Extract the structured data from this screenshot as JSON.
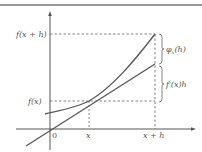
{
  "diagram": {
    "colors": {
      "axis": "#555555",
      "curve": "#5a5a5a",
      "tangent": "#5a5a5a",
      "dashed": "#666666",
      "border": "#777777",
      "text": "#555555"
    },
    "labels": {
      "fxh": "f(x + h)",
      "fx": "f(x)",
      "origin": "0",
      "x": "x",
      "xh": "x + h",
      "phi_main": "φ",
      "phi_sub": "x",
      "phi_arg": "(h)",
      "fprime": "f′(x)h"
    }
  }
}
